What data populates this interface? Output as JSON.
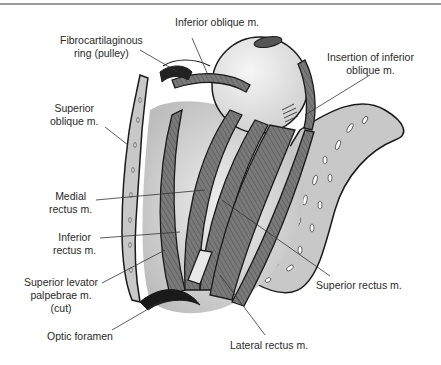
{
  "figure": {
    "labels": [
      {
        "id": "inferior-oblique",
        "text": "Inferior oblique m."
      },
      {
        "id": "pulley",
        "line1": "Fibrocartilaginous",
        "line2": "ring (pulley)"
      },
      {
        "id": "insertion-inferior-oblique",
        "line1": "Insertion of inferior",
        "line2": "oblique m."
      },
      {
        "id": "superior-oblique",
        "line1": "Superior",
        "line2": "oblique m."
      },
      {
        "id": "medial-rectus",
        "line1": "Medial",
        "line2": "rectus m."
      },
      {
        "id": "inferior-rectus",
        "line1": "Inferior",
        "line2": "rectus m."
      },
      {
        "id": "superior-levator",
        "line1": "Superior levator",
        "line2": "palpebrae m.",
        "line3": "(cut)"
      },
      {
        "id": "optic-foramen",
        "text": "Optic foramen"
      },
      {
        "id": "superior-rectus",
        "text": "Superior rectus m."
      },
      {
        "id": "lateral-rectus",
        "text": "Lateral rectus m."
      }
    ],
    "colors": {
      "bone": "#c8c8c8",
      "muscle": "#6e6e6e",
      "globe": "#e6e6e6",
      "outline": "#1a1a1a",
      "leader": "#333333",
      "rule": "#9a9a9a"
    }
  }
}
